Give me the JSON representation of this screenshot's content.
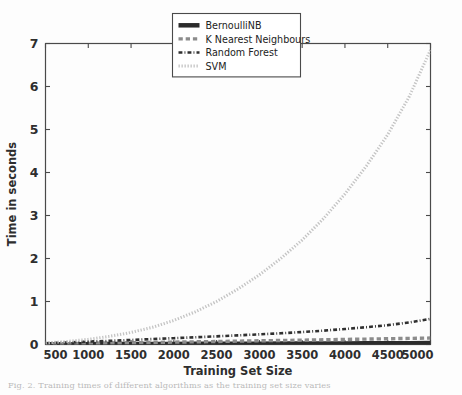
{
  "figure": {
    "background_color": "#fdfdfd",
    "caption": "Fig. 2. Training times of different algorithms as the training set size varies"
  },
  "chart_data": {
    "type": "line",
    "title": "",
    "xlabel": "Training Set Size",
    "ylabel": "Time in seconds",
    "xlim": [
      500,
      5000
    ],
    "ylim": [
      0,
      7
    ],
    "xticks": [
      500,
      1000,
      1500,
      2000,
      2500,
      3000,
      3500,
      4000,
      4500,
      5000
    ],
    "xtick_labels": [
      "500",
      "1000",
      "1500",
      "2000",
      "2500",
      "3000",
      "3500",
      "4000",
      "4500",
      "5000"
    ],
    "yticks": [
      0,
      1,
      2,
      3,
      4,
      5,
      6,
      7
    ],
    "ytick_labels": [
      "0",
      "1",
      "2",
      "3",
      "4",
      "5",
      "6",
      "7"
    ],
    "grid": false,
    "legend_position": "upper center",
    "x": [
      500,
      750,
      1000,
      1250,
      1500,
      1750,
      2000,
      2250,
      2500,
      2750,
      3000,
      3250,
      3500,
      3750,
      4000,
      4250,
      4500,
      4750,
      5000
    ],
    "series": [
      {
        "name": "BernoulliNB",
        "color": "#2b2b2b",
        "linestyle": "solid",
        "linewidth": 4.5,
        "values": [
          0.005,
          0.006,
          0.008,
          0.009,
          0.011,
          0.012,
          0.014,
          0.015,
          0.017,
          0.018,
          0.02,
          0.021,
          0.023,
          0.024,
          0.026,
          0.027,
          0.029,
          0.03,
          0.032
        ]
      },
      {
        "name": "K Nearest Neighbours",
        "color": "#8c8c8c",
        "linestyle": "dashed",
        "linewidth": 3.4,
        "values": [
          0.012,
          0.018,
          0.025,
          0.032,
          0.04,
          0.047,
          0.055,
          0.062,
          0.07,
          0.078,
          0.086,
          0.093,
          0.101,
          0.11,
          0.118,
          0.126,
          0.134,
          0.142,
          0.15
        ]
      },
      {
        "name": "Random Forest",
        "color": "#303030",
        "linestyle": "dashdot",
        "linewidth": 2.6,
        "values": [
          0.03,
          0.048,
          0.066,
          0.086,
          0.105,
          0.126,
          0.147,
          0.168,
          0.19,
          0.213,
          0.236,
          0.261,
          0.29,
          0.322,
          0.36,
          0.402,
          0.45,
          0.512,
          0.595
        ]
      },
      {
        "name": "SVM",
        "color": "#c4c4c4",
        "linestyle": "dotted",
        "linewidth": 3.0,
        "values": [
          0.035,
          0.07,
          0.12,
          0.19,
          0.28,
          0.4,
          0.56,
          0.76,
          1.0,
          1.29,
          1.62,
          2.0,
          2.43,
          2.93,
          3.5,
          4.15,
          4.88,
          5.76,
          6.85
        ]
      }
    ]
  },
  "legend": {
    "items": [
      {
        "label": "BernoulliNB"
      },
      {
        "label": "K Nearest Neighbours"
      },
      {
        "label": "Random Forest"
      },
      {
        "label": "SVM"
      }
    ]
  }
}
